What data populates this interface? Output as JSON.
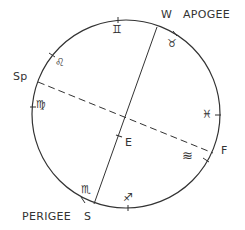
{
  "diagram": {
    "type": "orbit-diagram",
    "colors": {
      "stroke": "#333333",
      "background": "#ffffff"
    },
    "circle": {
      "cx": 126,
      "cy": 114,
      "r": 94
    },
    "apsidal_line": {
      "style": "solid",
      "from": {
        "x": 157,
        "y": 27
      },
      "to": {
        "x": 94,
        "y": 204
      }
    },
    "dashed_line": {
      "style": "dashed",
      "from": {
        "x": 38,
        "y": 82
      },
      "to": {
        "x": 213,
        "y": 153
      }
    },
    "labels": {
      "apogee": "APOGEE",
      "w": "W",
      "perigee": "PERIGEE",
      "s": "S",
      "sp": "Sp",
      "f": "F",
      "e": "E"
    },
    "zodiac_signs": [
      {
        "name": "gemini",
        "glyph": "♊",
        "x": 114,
        "y": 24
      },
      {
        "name": "taurus",
        "glyph": "♉",
        "x": 169,
        "y": 36
      },
      {
        "name": "leo",
        "glyph": "♌",
        "x": 57,
        "y": 56
      },
      {
        "name": "virgo",
        "glyph": "♍",
        "x": 36,
        "y": 101
      },
      {
        "name": "pisces",
        "glyph": "♓",
        "x": 202,
        "y": 110
      },
      {
        "name": "aquarius",
        "glyph": "≋",
        "x": 184,
        "y": 150
      },
      {
        "name": "scorpio",
        "glyph": "♏",
        "x": 82,
        "y": 187
      },
      {
        "name": "sagittarius",
        "glyph": "♐",
        "x": 124,
        "y": 193
      }
    ],
    "ticks": [
      {
        "x": 118,
        "y": 20
      },
      {
        "x": 175,
        "y": 34
      },
      {
        "x": 52,
        "y": 55
      },
      {
        "x": 33,
        "y": 107
      },
      {
        "x": 218,
        "y": 115
      },
      {
        "x": 206,
        "y": 160
      },
      {
        "x": 83,
        "y": 200
      },
      {
        "x": 128,
        "y": 208
      }
    ],
    "e_marker": {
      "x": 119,
      "y": 136
    }
  }
}
